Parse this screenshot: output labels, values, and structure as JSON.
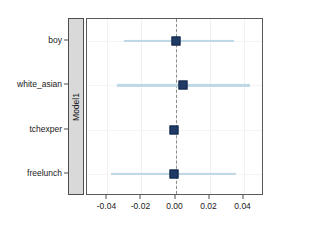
{
  "chart_data": {
    "type": "scatter",
    "title": "",
    "subtitle": "",
    "xlabel": "",
    "ylabel": "",
    "facet_label": "Model1",
    "xlim": [
      -0.052,
      0.052
    ],
    "xticks": [
      -0.04,
      -0.02,
      0.0,
      0.02,
      0.04
    ],
    "xticklabels": [
      "-0.04",
      "-0.02",
      "0.00",
      "0.02",
      "0.04"
    ],
    "categories": [
      "boy",
      "white_asian",
      "tchexper",
      "freelunch"
    ],
    "grid": true,
    "legend": "none",
    "reference_line": 0.0,
    "reference_line_style": "dashed",
    "marker_color": "#1f3b66",
    "ci_color": "#bdd7e7",
    "reference_color": "#8c8c8c",
    "strip_color": "#d9d9d9",
    "panel_border_color": "#595959",
    "points": [
      {
        "label": "boy",
        "estimate": 0.0005,
        "ci_low": -0.0305,
        "ci_high": 0.0345
      },
      {
        "label": "white_asian",
        "estimate": 0.0043,
        "ci_low": -0.0345,
        "ci_high": 0.0435
      },
      {
        "label": "tchexper",
        "estimate": -0.0006,
        "ci_low": -0.0022,
        "ci_high": 0.001
      },
      {
        "label": "freelunch",
        "estimate": -0.0008,
        "ci_low": -0.038,
        "ci_high": 0.0358
      }
    ]
  }
}
